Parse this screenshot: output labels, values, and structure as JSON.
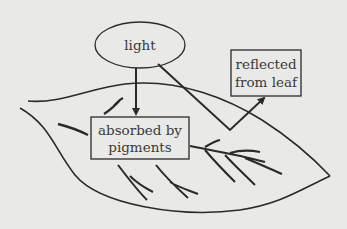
{
  "diagram": {
    "nodes": {
      "light": {
        "label": "light",
        "shape": "ellipse"
      },
      "absorbed": {
        "line1": "absorbed by",
        "line2": "pigments",
        "shape": "box"
      },
      "reflected": {
        "line1": "reflected",
        "line2": "from leaf",
        "shape": "box"
      }
    },
    "edges": [
      {
        "from": "light",
        "to": "absorbed",
        "type": "arrow"
      },
      {
        "from": "light",
        "to": "reflected",
        "type": "arrow",
        "path": "bounces off leaf surface"
      }
    ],
    "background_object": "leaf",
    "colors": {
      "background": "#e9e9e7",
      "stroke": "#2a2a2a",
      "text": "#3a3a3a"
    }
  }
}
